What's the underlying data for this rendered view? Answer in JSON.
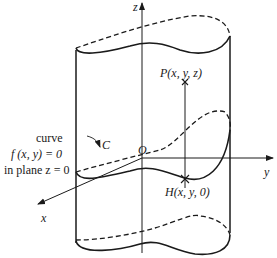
{
  "diagram": {
    "type": "cylinder-surface",
    "axes": {
      "x_label": "x",
      "y_label": "y",
      "z_label": "z",
      "origin_label": "O"
    },
    "points": {
      "P_label": "P(x, y, z)",
      "H_label": "H(x, y, 0)"
    },
    "curve": {
      "name_label": "C",
      "annotation_line1": "curve",
      "annotation_line2": "f (x, y) = 0",
      "annotation_line3": "in plane z = 0"
    },
    "colors": {
      "stroke": "#1a1a1a",
      "background": "#ffffff"
    }
  }
}
